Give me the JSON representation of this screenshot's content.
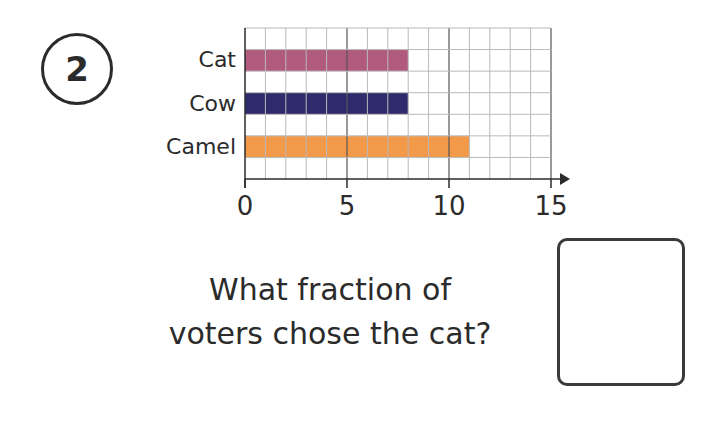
{
  "question_number": "2",
  "question_text_line1": "What fraction of",
  "question_text_line2": "voters chose the cat?",
  "answer_box": {
    "value": ""
  },
  "colors": {
    "cat": "#b05a7e",
    "cow": "#2f2a6b",
    "camel": "#f39a4a",
    "grid": "#b9b9b9",
    "axis": "#2b2b2b"
  },
  "chart_data": {
    "type": "bar",
    "orientation": "horizontal",
    "title": "",
    "categories": [
      "Cat",
      "Cow",
      "Camel"
    ],
    "values": [
      8,
      8,
      11
    ],
    "colors": [
      "#b05a7e",
      "#2f2a6b",
      "#f39a4a"
    ],
    "xlabel": "",
    "ylabel": "",
    "xlim": [
      0,
      15
    ],
    "xticks": [
      0,
      5,
      10,
      15
    ],
    "grid": true,
    "legend": "none"
  }
}
